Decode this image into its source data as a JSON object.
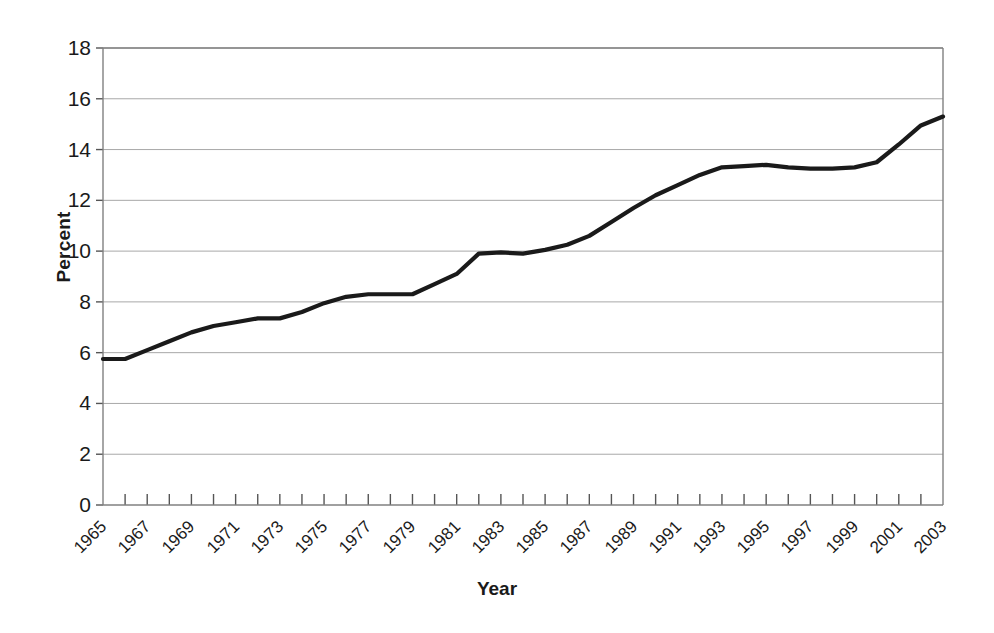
{
  "chart_data": {
    "type": "line",
    "title": "",
    "xlabel": "Year",
    "ylabel": "Percent",
    "xlim": [
      1965,
      2003
    ],
    "ylim": [
      0,
      18
    ],
    "ytick_step": 2,
    "yticks": [
      0,
      2,
      4,
      6,
      8,
      10,
      12,
      14,
      16,
      18
    ],
    "xticks_all_years": true,
    "xtick_labels": [
      "1965",
      "1967",
      "1969",
      "1971",
      "1973",
      "1975",
      "1977",
      "1979",
      "1981",
      "1983",
      "1985",
      "1987",
      "1989",
      "1991",
      "1993",
      "1995",
      "1997",
      "1999",
      "2001",
      "2003"
    ],
    "grid": "horizontal",
    "legend": "none",
    "line_color": "#1a1a1a",
    "grid_color": "#a8a8a8",
    "axis_color": "#808080",
    "x": [
      1965,
      1966,
      1967,
      1968,
      1969,
      1970,
      1971,
      1972,
      1973,
      1974,
      1975,
      1976,
      1977,
      1978,
      1979,
      1980,
      1981,
      1982,
      1983,
      1984,
      1985,
      1986,
      1987,
      1988,
      1989,
      1990,
      1991,
      1992,
      1993,
      1994,
      1995,
      1996,
      1997,
      1998,
      1999,
      2000,
      2001,
      2002,
      2003
    ],
    "values": [
      5.75,
      5.75,
      6.1,
      6.45,
      6.8,
      7.05,
      7.2,
      7.35,
      7.35,
      7.6,
      7.95,
      8.2,
      8.3,
      8.3,
      8.3,
      8.7,
      9.1,
      9.9,
      9.95,
      9.9,
      10.05,
      10.25,
      10.6,
      11.15,
      11.7,
      12.2,
      12.6,
      13.0,
      13.3,
      13.35,
      13.4,
      13.3,
      13.25,
      13.25,
      13.3,
      13.5,
      14.2,
      14.95,
      15.3
    ]
  },
  "geometry": {
    "plot_left": 103,
    "plot_right": 943,
    "plot_top": 48,
    "plot_bottom": 505
  }
}
